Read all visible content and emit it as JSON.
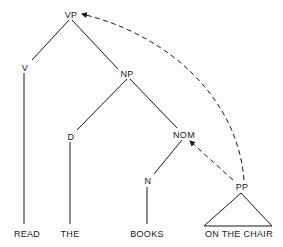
{
  "diagram": {
    "type": "syntax-tree",
    "nodes": {
      "vp": "VP",
      "v": "V",
      "np": "NP",
      "d": "D",
      "nom": "NOM",
      "n": "N",
      "pp": "PP"
    },
    "leaves": {
      "read": "READ",
      "the": "THE",
      "books": "BOOKS",
      "on_the_chair": "ON THE CHAIR"
    },
    "edges": [
      [
        "VP",
        "V"
      ],
      [
        "VP",
        "NP"
      ],
      [
        "V",
        "READ"
      ],
      [
        "NP",
        "D"
      ],
      [
        "NP",
        "NOM"
      ],
      [
        "D",
        "THE"
      ],
      [
        "NOM",
        "N"
      ],
      [
        "N",
        "BOOKS"
      ],
      [
        "PP",
        "ON THE CHAIR"
      ]
    ],
    "movement_arrows": [
      {
        "from": "PP",
        "to": "NOM",
        "style": "dashed"
      },
      {
        "from": "PP",
        "to": "VP",
        "style": "dashed"
      }
    ],
    "colors": {
      "ink": "#1a1a1a",
      "background": "#fdfdfd"
    }
  }
}
